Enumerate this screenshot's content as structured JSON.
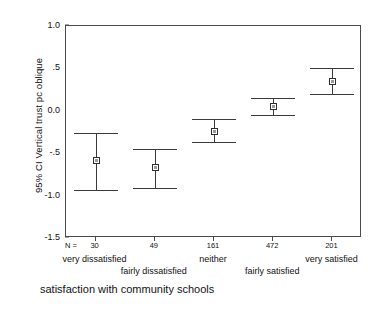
{
  "chart_data": {
    "type": "scatter",
    "title": "",
    "subtitle": "",
    "ylabel": "95% CI Vertical trust pc oblique",
    "xlabel": "satisfaction with community schools",
    "ylim": [
      -1.5,
      1.0
    ],
    "grid": false,
    "legend": "none",
    "y_ticks": [
      "1.0",
      ".5",
      "0.0",
      "-.5",
      "-1.0",
      "-1.5"
    ],
    "y_tick_values": [
      1.0,
      0.5,
      0.0,
      -0.5,
      -1.0,
      -1.5
    ],
    "n_prefix": "N =",
    "categories": [
      "very dissatisfied",
      "fairly dissatisfied",
      "neither",
      "fairly satisfied",
      "very satisfied"
    ],
    "n_values": [
      "30",
      "49",
      "161",
      "472",
      "201"
    ],
    "series": [
      {
        "name": "mean with 95% CI",
        "values": [
          -0.59,
          -0.67,
          -0.24,
          0.05,
          0.35
        ],
        "ci_lower": [
          -0.93,
          -0.91,
          -0.37,
          -0.05,
          0.2
        ],
        "ci_upper": [
          -0.26,
          -0.45,
          -0.1,
          0.15,
          0.51
        ]
      }
    ]
  },
  "colors": {
    "axis": "#4a4a4a",
    "marker_edge": "#2e2e2e",
    "marker_fill": "#ffffff",
    "errorbar": "#3a3a3a",
    "text": "#111111",
    "background": "#ffffff"
  }
}
